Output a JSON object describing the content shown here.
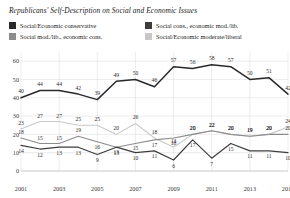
{
  "title": "Republicans' Self-Description on Social and Economic Issues",
  "legend": [
    {
      "label": "Social/Economic conservative",
      "color": "#2a2a2a"
    },
    {
      "label": "Social cons., economic mod./lib.",
      "color": "#3d3d3d"
    },
    {
      "label": "Social mod./lib., economic cons.",
      "color": "#8c8c8c"
    },
    {
      "label": "Social/Economic moderate/liberal",
      "color": "#c8c8c8"
    }
  ],
  "chart_data": {
    "type": "line",
    "title": "Republicans' Self-Description on Social and Economic Issues",
    "xlabel": "",
    "ylabel": "",
    "x": [
      2001,
      2002,
      2003,
      2004,
      2005,
      2006,
      2007,
      2008,
      2009,
      2010,
      2011,
      2012,
      2013,
      2014,
      2015
    ],
    "xticks": [
      "2001",
      "2003",
      "2005",
      "2007",
      "2009",
      "2011",
      "2013",
      "2015"
    ],
    "yticks": [
      "0",
      "10",
      "20",
      "30",
      "40",
      "50",
      "60"
    ],
    "ylim": [
      0,
      65
    ],
    "grid": true,
    "legend_position": "top",
    "series": [
      {
        "name": "Social/Economic conservative",
        "color": "#2a2a2a",
        "values": [
          40,
          44,
          44,
          42,
          39,
          49,
          50,
          46,
          57,
          56,
          58,
          57,
          50,
          51,
          42
        ]
      },
      {
        "name": "Social cons., economic mod./lib.",
        "color": "#3d3d3d",
        "values": [
          14,
          12,
          13,
          13,
          9,
          13,
          10,
          11,
          6,
          17,
          7,
          15,
          11,
          11,
          10
        ]
      },
      {
        "name": "Social mod./lib., economic cons.",
        "color": "#8c8c8c",
        "values": [
          18,
          15,
          15,
          19,
          16,
          13,
          15,
          17,
          18,
          20,
          22,
          20,
          19,
          20,
          20
        ]
      },
      {
        "name": "Social/Economic moderate/liberal",
        "color": "#c8c8c8",
        "values": [
          23,
          27,
          27,
          25,
          25,
          20,
          26,
          18,
          13,
          20,
          22,
          20,
          19,
          20,
          24
        ]
      }
    ]
  }
}
